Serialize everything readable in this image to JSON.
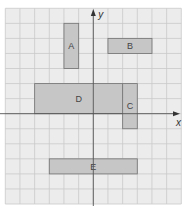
{
  "diagram": {
    "type": "coordinate-grid",
    "axes": {
      "x_label": "x",
      "y_label": "y"
    },
    "grid": {
      "x_min": -6,
      "x_max": 6,
      "y_min": -6,
      "y_max": 7
    },
    "colors": {
      "background": "#ececec",
      "grid_line": "#c9c9c9",
      "axis": "#555555",
      "rect_fill": "#c6c6c6",
      "rect_stroke": "#7a7a7a"
    },
    "rectangles": [
      {
        "label": "A",
        "x1": -2,
        "y1": 3,
        "x2": -1,
        "y2": 6
      },
      {
        "label": "B",
        "x1": 1,
        "y1": 4,
        "x2": 4,
        "y2": 5
      },
      {
        "label": "D",
        "x1": -4,
        "y1": 0,
        "x2": 2,
        "y2": 2
      },
      {
        "label": "C",
        "x1": 2,
        "y1": -1,
        "x2": 3,
        "y2": 2
      },
      {
        "label": "E",
        "x1": -3,
        "y1": -4,
        "x2": 3,
        "y2": -3
      }
    ]
  }
}
